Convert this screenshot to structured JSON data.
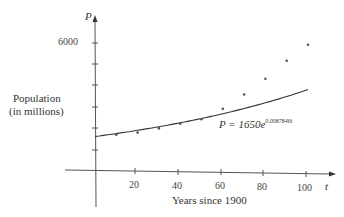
{
  "chart_data": {
    "type": "scatter",
    "title": "",
    "xlabel": "Years since 1900",
    "ylabel": "Population (in millions)",
    "x_axis_symbol": "t",
    "y_axis_symbol": "P",
    "x_ticks": [
      "20",
      "40",
      "60",
      "80",
      "100"
    ],
    "y_tick_labels": [
      "6000"
    ],
    "xlim": [
      -5,
      105
    ],
    "ylim": [
      -1500,
      7000
    ],
    "grid": false,
    "series": [
      {
        "name": "Observed population",
        "kind": "points",
        "x": [
          10,
          20,
          30,
          40,
          50,
          60,
          70,
          80,
          90,
          100
        ],
        "y": [
          1750,
          1860,
          2070,
          2300,
          2520,
          3020,
          3700,
          4450,
          5300,
          6060
        ]
      },
      {
        "name": "Exponential model",
        "kind": "line",
        "formula": "P = 1650e^{0.0087846t}",
        "x_range": [
          0,
          100
        ]
      }
    ],
    "annotations": [
      {
        "text": "P = 1650e",
        "superscript": "0.0087846t"
      }
    ]
  },
  "labels": {
    "y_symbol": "P",
    "x_symbol": "t",
    "y_label_line1": "Population",
    "y_label_line2": "(in millions)",
    "x_label": "Years since 1900",
    "y_tick_6000": "6000",
    "x_ticks": [
      "20",
      "40",
      "60",
      "80",
      "100"
    ],
    "equation_main": "P = 1650e",
    "equation_exp": "0.0087846t"
  }
}
